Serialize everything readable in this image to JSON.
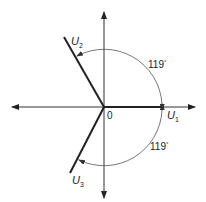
{
  "diagram": {
    "origin_label": "0",
    "vectors": [
      {
        "name": "U1",
        "label_main": "U",
        "label_sub": "1",
        "angle_deg": 0
      },
      {
        "name": "U2",
        "label_main": "U",
        "label_sub": "2",
        "angle_deg": 119
      },
      {
        "name": "U3",
        "label_main": "U",
        "label_sub": "3",
        "angle_deg": -119
      }
    ],
    "angle_annotations": [
      {
        "text": "119",
        "unit": "°",
        "between": [
          "U1",
          "U2"
        ]
      },
      {
        "text": "119",
        "unit": "°",
        "between": [
          "U1",
          "U3"
        ]
      }
    ],
    "colors": {
      "stroke": "#222222",
      "axis": "#333333",
      "arc": "#555555"
    }
  }
}
